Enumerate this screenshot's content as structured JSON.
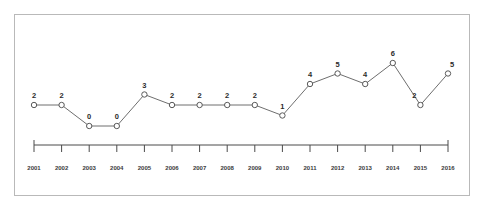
{
  "chart_data": {
    "type": "line",
    "title": "",
    "subtitle": "",
    "xlabel": "",
    "ylabel": "",
    "grid": false,
    "legend": "none",
    "axis_style": "x-axis only, ticks below axis, no y-axis",
    "categories": [
      "2001",
      "2002",
      "2003",
      "2004",
      "2005",
      "2006",
      "2007",
      "2008",
      "2009",
      "2010",
      "2011",
      "2012",
      "2013",
      "2014",
      "2015",
      "2016"
    ],
    "values": [
      2,
      2,
      0,
      0,
      3,
      2,
      2,
      2,
      2,
      1,
      4,
      5,
      4,
      6,
      2,
      5
    ],
    "point_labels": [
      "2",
      "2",
      "0",
      "0",
      "3",
      "2",
      "2",
      "2",
      "2",
      "1",
      "4",
      "5",
      "4",
      "6",
      "2",
      "5"
    ],
    "xlim": [
      "2001",
      "2016"
    ],
    "ylim": [
      0,
      6
    ],
    "series": [
      {
        "name": "series-1",
        "values": [
          2,
          2,
          0,
          0,
          3,
          2,
          2,
          2,
          2,
          1,
          4,
          5,
          4,
          6,
          2,
          5
        ]
      }
    ]
  },
  "style": {
    "line_color": "#6e6e6e",
    "marker_fill": "#ffffff",
    "marker_edge": "#5a5a5a",
    "axis_color": "#4a4a4a",
    "frame_color": "#b9b9b9",
    "label_color": "#2b2b2b",
    "background": "#ffffff"
  }
}
